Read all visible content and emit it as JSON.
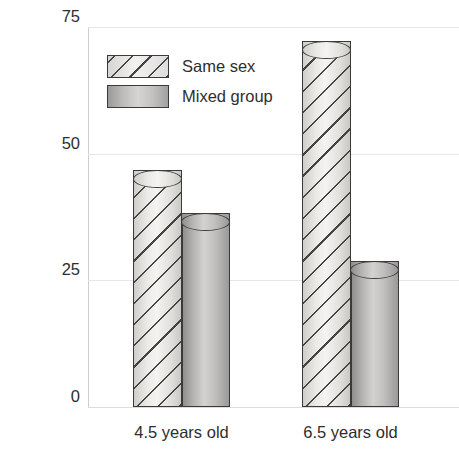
{
  "chart_data": {
    "type": "bar",
    "title": "",
    "subtitle": "",
    "xlabel": "",
    "ylabel": "Percentage of social playtime",
    "categories": [
      "4.5 years old",
      "6.5 years old"
    ],
    "series": [
      {
        "name": "Same sex",
        "values": [
          45,
          70.5
        ],
        "style": "diagonal-hatch"
      },
      {
        "name": "Mixed group",
        "values": [
          36.5,
          27
        ],
        "style": "solid-gradient"
      }
    ],
    "ylim": [
      0,
      75
    ],
    "yticks": [
      0,
      25,
      50,
      75
    ],
    "ytick_labels": [
      "0",
      "25",
      "50",
      "75"
    ],
    "grid": true,
    "grid_axis": "y",
    "legend_position": "top-center-inside",
    "colors": {
      "same_sex_fill": "#eceae7",
      "mixed_group_fill": "#b8b7b5",
      "bar_outline": "#3a3a3a",
      "gridline": "#e8e6e6",
      "text": "#2e2e2e"
    }
  },
  "axes": {
    "y_title": "Percentage of social playtime",
    "y_ticks": [
      {
        "label": "75",
        "value": 75
      },
      {
        "label": "50",
        "value": 50
      },
      {
        "label": "25",
        "value": 25
      },
      {
        "label": "0",
        "value": 0
      }
    ],
    "x_ticks": [
      {
        "label": "4.5 years old"
      },
      {
        "label": "6.5 years old"
      }
    ]
  },
  "legend": {
    "items": [
      {
        "label": "Same sex",
        "swatch": "hatched-swatch"
      },
      {
        "label": "Mixed group",
        "swatch": "solid-swatch"
      }
    ]
  }
}
